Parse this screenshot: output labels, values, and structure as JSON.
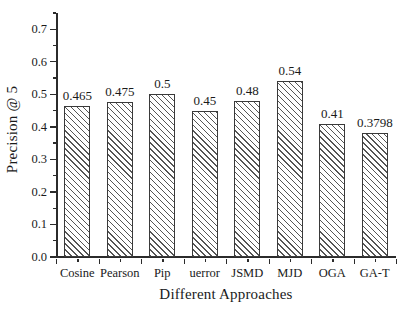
{
  "chart_data": {
    "type": "bar",
    "title": "",
    "xlabel": "Different Approaches",
    "ylabel": "Precision @ 5",
    "categories": [
      "Cosine",
      "Pearson",
      "Pip",
      "uerror",
      "JSMD",
      "MJD",
      "OGA",
      "GA-T"
    ],
    "values": [
      0.465,
      0.475,
      0.5,
      0.45,
      0.48,
      0.54,
      0.41,
      0.3798
    ],
    "value_labels": [
      "0.465",
      "0.475",
      "0.5",
      "0.45",
      "0.48",
      "0.54",
      "0.41",
      "0.3798"
    ],
    "ylim": [
      0.0,
      0.75
    ],
    "ytick_values": [
      0.0,
      0.1,
      0.2,
      0.3,
      0.4,
      0.5,
      0.6,
      0.7
    ],
    "ytick_labels": [
      "0.0",
      "0.1",
      "0.2",
      "0.3",
      "0.4",
      "0.5",
      "0.6",
      "0.7"
    ],
    "yminor_tick_values": [
      0.05,
      0.15,
      0.25,
      0.35,
      0.45,
      0.55,
      0.65,
      0.75
    ],
    "grid": false,
    "legend": null,
    "bar_fill": "hatched-diagonal",
    "bar_edge_color": "#3a3a3a",
    "hatch_color": "#555555",
    "background_color": "#ffffff",
    "axis_color": "#2b2b2b"
  }
}
